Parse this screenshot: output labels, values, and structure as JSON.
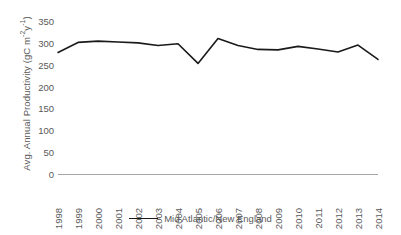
{
  "chart_data": {
    "type": "line",
    "title": "",
    "xlabel": "",
    "ylabel": "Avg. Annual Productivity (gC m⁻²y⁻¹)",
    "ylabel_parts": {
      "prefix": "Avg. Annual Productivity (gC m",
      "sup1": "-2",
      "mid": "y",
      "sup2": "-1",
      "suffix": ")"
    },
    "categories": [
      "1998",
      "1999",
      "2000",
      "2001",
      "2002",
      "2003",
      "2004",
      "2005",
      "2006",
      "2007",
      "2008",
      "2009",
      "2010",
      "2011",
      "2012",
      "2013",
      "2014"
    ],
    "x": [
      1998,
      1999,
      2000,
      2001,
      2002,
      2003,
      2004,
      2005,
      2006,
      2007,
      2008,
      2009,
      2010,
      2011,
      2012,
      2013,
      2014
    ],
    "series": [
      {
        "name": "Mid Atlantic/New England",
        "color": "#1a1a1a",
        "values": [
          278,
          301,
          304,
          302,
          300,
          294,
          298,
          253,
          310,
          294,
          285,
          284,
          292,
          286,
          279,
          295,
          262
        ]
      }
    ],
    "ylim": [
      0,
      350
    ],
    "yticks": [
      0,
      50,
      100,
      150,
      200,
      250,
      300,
      350
    ],
    "ytick_labels": [
      "0",
      "50",
      "100",
      "150",
      "200",
      "250",
      "300",
      "350"
    ],
    "grid": false,
    "legend_position": "bottom",
    "axis_color": "#a6a6a6",
    "text_color": "#595959"
  },
  "legend": {
    "entries": [
      {
        "label": "Mid Atlantic/New England",
        "color": "#1a1a1a"
      }
    ]
  }
}
